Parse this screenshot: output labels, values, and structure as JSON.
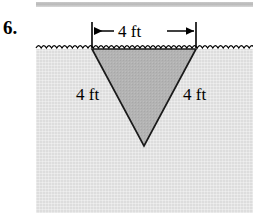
{
  "figure": {
    "problem_number": "6.",
    "type": "geometry-diagram",
    "colors": {
      "ground_fill": "#dddddd",
      "triangle_fill": "#b3b3b3",
      "line": "#000000",
      "top_rule": "#c0c0c0"
    },
    "labels": {
      "top_dimension": "4 ft",
      "left_side": "4 ft",
      "right_side": "4 ft"
    },
    "geometry": {
      "water_line_y": 49,
      "triangle_top_left": [
        92,
        49
      ],
      "triangle_top_right": [
        196,
        49
      ],
      "triangle_apex": [
        144,
        146
      ],
      "dimension_line_y": 31,
      "extension_left_x": 92,
      "extension_right_x": 196
    }
  }
}
